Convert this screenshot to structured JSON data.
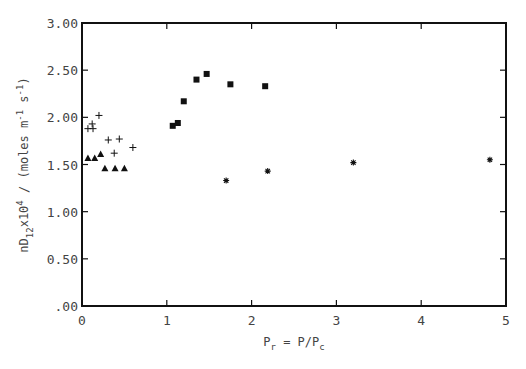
{
  "chart_data": {
    "type": "scatter",
    "title": "",
    "xlabel": "P_r = P/P_c",
    "xlabel_parts": {
      "main": "P",
      "sub": "r",
      "mid": " = P/P",
      "sub2": "c"
    },
    "ylabel": "nD_12 x 10^4 / (moles m^-1 s^-1)",
    "ylabel_parts": {
      "p1": "nD",
      "sub1": "12",
      "p2": "x10",
      "sup1": "4",
      "p3": " / (moles m",
      "sup2": "-1",
      "p4": " s",
      "sup3": "-1",
      "p5": ")"
    },
    "xlim": [
      0,
      5
    ],
    "ylim": [
      0,
      3.0
    ],
    "xticks": [
      0,
      1,
      2,
      3,
      4,
      5
    ],
    "xtick_labels": [
      "0",
      "1",
      "2",
      "3",
      "4",
      "5"
    ],
    "yticks": [
      0,
      0.5,
      1.0,
      1.5,
      2.0,
      2.5,
      3.0
    ],
    "ytick_labels": [
      ".00",
      "0.50",
      "1.00",
      "1.50",
      "2.00",
      "2.50",
      "3.00"
    ],
    "grid": false,
    "legend": null,
    "series": [
      {
        "name": "plus",
        "marker": "plus",
        "points": [
          [
            0.07,
            1.88
          ],
          [
            0.13,
            1.88
          ],
          [
            0.12,
            1.93
          ],
          [
            0.2,
            2.02
          ],
          [
            0.31,
            1.76
          ],
          [
            0.44,
            1.77
          ],
          [
            0.38,
            1.62
          ],
          [
            0.6,
            1.68
          ]
        ]
      },
      {
        "name": "triangle",
        "marker": "triangle",
        "points": [
          [
            0.07,
            1.57
          ],
          [
            0.15,
            1.57
          ],
          [
            0.22,
            1.61
          ],
          [
            0.27,
            1.46
          ],
          [
            0.39,
            1.46
          ],
          [
            0.5,
            1.46
          ]
        ]
      },
      {
        "name": "square",
        "marker": "square",
        "points": [
          [
            1.07,
            1.91
          ],
          [
            1.13,
            1.94
          ],
          [
            1.2,
            2.17
          ],
          [
            1.35,
            2.4
          ],
          [
            1.47,
            2.46
          ],
          [
            1.75,
            2.35
          ],
          [
            2.16,
            2.33
          ]
        ]
      },
      {
        "name": "asterisk",
        "marker": "asterisk",
        "points": [
          [
            1.7,
            1.33
          ],
          [
            2.19,
            1.43
          ],
          [
            3.2,
            1.52
          ],
          [
            4.81,
            1.55
          ]
        ]
      }
    ]
  },
  "colors": {
    "axis": "#111111",
    "marker": "#111111",
    "text": "#444444",
    "background": "#ffffff"
  }
}
